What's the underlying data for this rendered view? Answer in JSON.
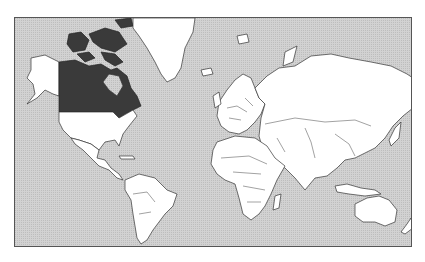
{
  "map": {
    "type": "world political outline map",
    "projection": "Mercator",
    "highlighted_country": "Canada",
    "colors": {
      "ocean": "#cfcfcf",
      "land": "#ffffff",
      "highlight": "#3a3a3a",
      "outline": "#333333",
      "frame": "#555555"
    },
    "regions": [
      {
        "name": "Canada",
        "highlighted": true
      },
      {
        "name": "Alaska (USA)",
        "highlighted": false
      },
      {
        "name": "United States",
        "highlighted": false
      },
      {
        "name": "Greenland",
        "highlighted": false
      },
      {
        "name": "Central America",
        "highlighted": false
      },
      {
        "name": "South America",
        "highlighted": false
      },
      {
        "name": "Europe",
        "highlighted": false
      },
      {
        "name": "Russia",
        "highlighted": false
      },
      {
        "name": "Asia",
        "highlighted": false
      },
      {
        "name": "Africa",
        "highlighted": false
      },
      {
        "name": "Madagascar",
        "highlighted": false
      },
      {
        "name": "Australia",
        "highlighted": false
      },
      {
        "name": "New Zealand",
        "highlighted": false
      },
      {
        "name": "Japan",
        "highlighted": false
      },
      {
        "name": "Indonesia",
        "highlighted": false
      }
    ]
  }
}
